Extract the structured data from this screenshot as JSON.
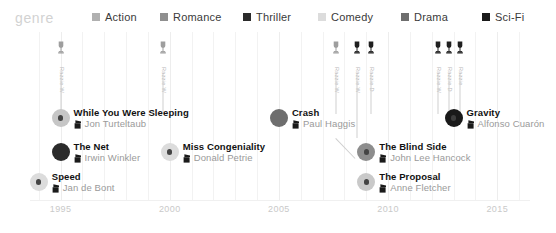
{
  "legend": {
    "title": "genre",
    "items": [
      {
        "label": "Action",
        "color": "#b0b0b0"
      },
      {
        "label": "Romance",
        "color": "#8f8f8f"
      },
      {
        "label": "Thriller",
        "color": "#2b2b2b"
      },
      {
        "label": "Comedy",
        "color": "#dcdcdc"
      },
      {
        "label": "Drama",
        "color": "#6e6e6e"
      },
      {
        "label": "Sci-Fi",
        "color": "#1a1a1a"
      }
    ]
  },
  "axis": {
    "ticks": [
      "1995",
      "2000",
      "2005",
      "2010",
      "2015"
    ],
    "tick_years": [
      1995,
      2000,
      2005,
      2010,
      2015
    ],
    "tick_color": "#c9c9c9"
  },
  "chart_data": {
    "type": "scatter",
    "title": "genre",
    "xlabel": "",
    "ylabel": "",
    "xlim": [
      1993.6,
      2016.5
    ],
    "grid": true,
    "legend_position": "top",
    "categories": [
      "Action",
      "Romance",
      "Thriller",
      "Comedy",
      "Drama",
      "Sci-Fi"
    ],
    "points": [
      {
        "title": "While You Were Sleeping",
        "director": "Jon Turteltaub",
        "year": 1995,
        "genre": "Romance",
        "color": "#8f8f8f",
        "halo": "#c6c6c6",
        "row": 1
      },
      {
        "title": "The Net",
        "director": "Irwin Winkler",
        "year": 1995,
        "genre": "Thriller",
        "color": "#2b2b2b",
        "halo": "#2b2b2b",
        "row": 2
      },
      {
        "title": "Speed",
        "director": "Jan de Bont",
        "year": 1994,
        "genre": "Action",
        "color": "#dcdcdc",
        "halo": "#dcdcdc",
        "row": 3
      },
      {
        "title": "Miss Congeniality",
        "director": "Donald Petrie",
        "year": 2000,
        "genre": "Comedy",
        "color": "#dcdcdc",
        "halo": "#dcdcdc",
        "row": 2
      },
      {
        "title": "Crash",
        "director": "Paul Haggis",
        "year": 2005,
        "genre": "Drama",
        "color": "#6e6e6e",
        "halo": "#6e6e6e",
        "row": 1
      },
      {
        "title": "The Blind Side",
        "director": "John Lee Hancock",
        "year": 2009,
        "genre": "Drama",
        "color": "#5a5a5a",
        "halo": "#8d8d8d",
        "row": 2
      },
      {
        "title": "The Proposal",
        "director": "Anne Fletcher",
        "year": 2009,
        "genre": "Comedy",
        "color": "#9a9a9a",
        "halo": "#c9c9c9",
        "row": 3
      },
      {
        "title": "Gravity",
        "director": "Alfonso Cuarón",
        "year": 2013,
        "genre": "Sci-Fi",
        "color": "#1a1a1a",
        "halo": "#1a1a1a",
        "row": 1
      }
    ],
    "awards": [
      {
        "label": "Razzie W",
        "year": 1995,
        "x": 61,
        "stem_height": 74,
        "filled": false
      },
      {
        "label": "Razzie W",
        "year": 2000,
        "x": 163,
        "stem_height": 74,
        "filled": false
      },
      {
        "label": "Razzie W",
        "year": 2008.6,
        "x": 336,
        "stem_height": 74,
        "filled": false
      },
      {
        "label": "Razzie W",
        "year": 2009.2,
        "x": 357,
        "stem_height": 98,
        "filled": true
      },
      {
        "label": "Razzie D",
        "year": 2009.6,
        "x": 371,
        "stem_height": 74,
        "filled": true
      },
      {
        "label": "Razzie W",
        "year": 2012.6,
        "x": 438,
        "stem_height": 74,
        "filled": true
      },
      {
        "label": "Razzie D",
        "year": 2013.0,
        "x": 449,
        "stem_height": 74,
        "filled": true
      },
      {
        "label": "Razzie",
        "year": 2013.4,
        "x": 460,
        "stem_height": 74,
        "filled": true
      }
    ]
  }
}
